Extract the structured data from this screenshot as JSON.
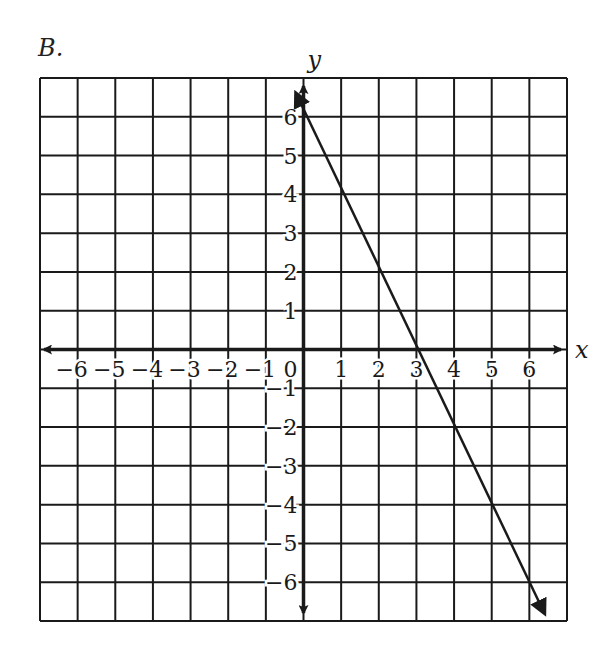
{
  "problem": {
    "label": "B."
  },
  "chart_data": {
    "type": "line",
    "title": "",
    "xlabel": "x",
    "ylabel": "y",
    "xlim": [
      -7,
      7
    ],
    "ylim": [
      -7,
      7
    ],
    "grid": true,
    "x_ticks": [
      -6,
      -5,
      -4,
      -3,
      -2,
      -1,
      1,
      2,
      3,
      4,
      5,
      6
    ],
    "y_ticks": [
      -6,
      -5,
      -4,
      -3,
      -2,
      -1,
      1,
      2,
      3,
      4,
      5,
      6
    ],
    "x_tick_labels": [
      "−6",
      "−5",
      "−4",
      "−3",
      "−2",
      "−1",
      "1",
      "2",
      "3",
      "4",
      "5",
      "6"
    ],
    "y_tick_labels": [
      "−6",
      "−5",
      "−4",
      "−3",
      "−2",
      "−1",
      "1",
      "2",
      "3",
      "4",
      "5",
      "6"
    ],
    "origin_label": "0",
    "series": [
      {
        "name": "y = -2x + 6",
        "equation": "y = -2x + 6",
        "slope": -2,
        "y_intercept": 6,
        "x_intercept": 3,
        "x": [
          -0.2,
          0,
          1,
          2,
          3,
          4,
          5,
          6,
          6.4
        ],
        "y": [
          6.4,
          6,
          4,
          2,
          0,
          -2,
          -4,
          -6,
          -6.8
        ],
        "arrows_both_ends": true
      }
    ]
  },
  "colors": {
    "ink": "#1a1a1a",
    "background": "#ffffff"
  }
}
